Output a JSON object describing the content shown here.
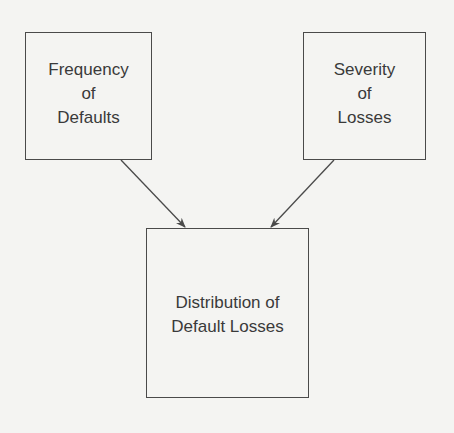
{
  "diagram": {
    "nodes": {
      "frequency": {
        "lines": [
          "Frequency",
          "of",
          "Defaults"
        ]
      },
      "severity": {
        "lines": [
          "Severity",
          "of",
          "Losses"
        ]
      },
      "distribution": {
        "lines": [
          "Distribution of",
          "Default Losses"
        ]
      }
    },
    "edges": [
      {
        "from": "frequency",
        "to": "distribution"
      },
      {
        "from": "severity",
        "to": "distribution"
      }
    ],
    "colors": {
      "stroke": "#4a4a4a",
      "text": "#3a3a3a",
      "background": "#f4f4f2"
    }
  }
}
